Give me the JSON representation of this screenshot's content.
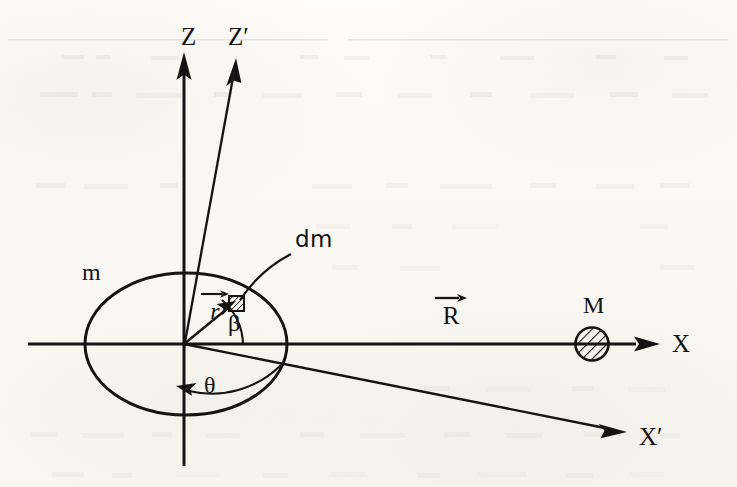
{
  "figure": {
    "kind": "physics-vector-diagram",
    "background_color": "#fbfaf7",
    "ink_color": "#141414",
    "width": 737,
    "height": 487
  },
  "axes": [
    {
      "id": "z",
      "label": "Z",
      "orientation": "vertical",
      "note": "unprimed vertical axis through origin"
    },
    {
      "id": "z-prime",
      "label": "Z′",
      "orientation": "tilted-up-right",
      "note": "primed vertical axis tilted from Z"
    },
    {
      "id": "x",
      "label": "X",
      "orientation": "horizontal",
      "note": "unprimed horizontal axis through origin and M"
    },
    {
      "id": "x-prime",
      "label": "X′",
      "orientation": "tilted-down-right",
      "note": "primed horizontal axis tilted from X"
    }
  ],
  "bodies": {
    "extended": {
      "label": "m",
      "shape": "ellipse",
      "note": "extended body of mass m centred on the origin"
    },
    "point": {
      "label": "M",
      "shape": "hatched-circle",
      "note": "point mass M on the X axis"
    },
    "element": {
      "label": "dm",
      "shape": "hatched-square",
      "note": "differential mass element inside body m"
    }
  },
  "vectors": [
    {
      "id": "r",
      "symbol": "r",
      "accent": "arrow",
      "note": "position vector from origin to mass element dm"
    },
    {
      "id": "R",
      "symbol": "R",
      "accent": "arrow",
      "note": "separation vector from origin of m to point mass M"
    }
  ],
  "angles": [
    {
      "id": "beta",
      "label": "β",
      "note": "angle between the X axis and the vector r"
    },
    {
      "id": "theta",
      "label": "θ",
      "note": "angle swept from the X′ axis round to the lower Z axis"
    }
  ],
  "labels": {
    "z": "Z",
    "z_prime": "Z′",
    "x": "X",
    "x_prime": "X′",
    "m": "m",
    "M": "M",
    "dm": "dm",
    "r": "r",
    "R": "R",
    "beta": "β",
    "theta": "θ"
  }
}
